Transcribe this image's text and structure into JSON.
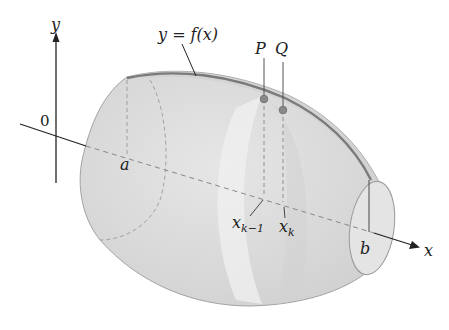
{
  "figure": {
    "curve_label": "y = f(x)",
    "axes": {
      "y_label": "y",
      "x_label": "x",
      "origin_label": "0"
    },
    "points": {
      "p_label": "P",
      "q_label": "Q"
    },
    "ticks": {
      "a_label": "a",
      "b_label": "b",
      "xk1_base": "x",
      "xk1_sub": "k−1",
      "xk_base": "x",
      "xk_sub": "k"
    },
    "colors": {
      "solid_fill": "#dcdcdc",
      "solid_edge": "#9a9a9a",
      "curve": "#7a7a7a",
      "slice_band": "#ebebeb",
      "axis": "#222222",
      "dash": "#888888"
    }
  }
}
